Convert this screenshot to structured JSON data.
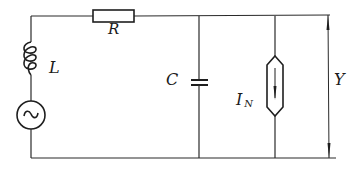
{
  "diagram": {
    "type": "circuit-schematic",
    "components": {
      "resistor": {
        "label": "R"
      },
      "inductor": {
        "label": "L"
      },
      "source": {
        "label": "~",
        "kind": "AC voltage source"
      },
      "capacitor": {
        "label": "C"
      },
      "current_source": {
        "label": "I",
        "subscript": "N"
      },
      "admittance": {
        "label": "Y"
      }
    },
    "colors": {
      "line": "#2a2a2a",
      "background": "#ffffff"
    }
  }
}
